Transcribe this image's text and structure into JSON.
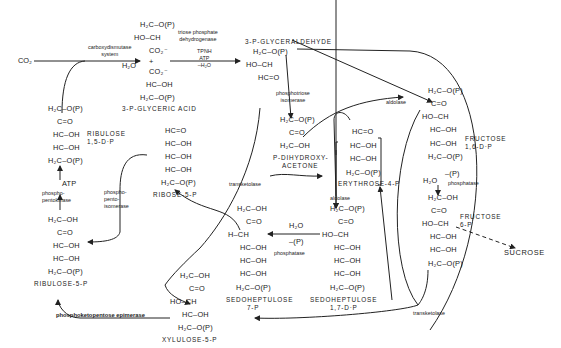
{
  "figure": {
    "inputs": {
      "co2": "CO₂",
      "h2o_in": "H₂O"
    },
    "outputs": {
      "sucrose": "SUCROSE"
    },
    "molecules": {
      "pga_top": [
        "H₂C–O(P)",
        "HO–CH",
        "CO₂⁻"
      ],
      "pga_plus": "+",
      "pga_bottom": [
        "CO₂⁻",
        "HC–OH",
        "H₂C–O(P)"
      ],
      "pga_label": "3-P-GLYCERIC ACID",
      "g3p": [
        "H₂C–O(P)",
        "HO–CH",
        "HC=O"
      ],
      "g3p_label": "3-P-GLYCERALDEHYDE",
      "dhap": [
        "H₂C–O(P)",
        "C=O",
        "H₂C–OH"
      ],
      "dhap_label": [
        "P-DIHYDROXY-",
        "ACETONE"
      ],
      "fdp": [
        "H₂C–O(P)",
        "C=O",
        "HO–CH",
        "HC–OH",
        "HC–OH",
        "H₂C–O(P)"
      ],
      "fdp_label": [
        "FRUCTOSE",
        "1,6-D·P"
      ],
      "f6p": [
        "H₂C–OH",
        "C=O",
        "HO–CH",
        "HC–OH",
        "HC–OH",
        "H₂C–O(P)"
      ],
      "f6p_label": [
        "FRUCTOSE",
        "6-P"
      ],
      "e4p": [
        "HC=O",
        "HC–OH",
        "HC–OH",
        "H₂C–O(P)"
      ],
      "e4p_label": "ERYTHROSE-4-P",
      "sdp": [
        "H₂C–O(P)",
        "C=O",
        "HO–CH",
        "HC–OH",
        "HC–OH",
        "HC–OH",
        "H₂C–O(P)"
      ],
      "sdp_label": [
        "SEDOHEPTULOSE",
        "1,7-D·P"
      ],
      "s7p": [
        "H₂C–OH",
        "C=O",
        "H–CH",
        "HC–OH",
        "HC–OH",
        "HC–OH",
        "H₂C–O(P)"
      ],
      "s7p_label": [
        "SEDOHEPTULOSE",
        "7-P"
      ],
      "r5p": [
        "HC=O",
        "HC–OH",
        "HC–OH",
        "HC–OH",
        "H₂C–O(P)"
      ],
      "r5p_label": "RIBOSE-5-P",
      "rudp": [
        "H₂C–O(P)",
        "C=O",
        "HC–OH",
        "HC–OH",
        "H₂C–O(P)"
      ],
      "rudp_label": [
        "RIBULOSE",
        "1,5-D·P"
      ],
      "ru5p": [
        "H₂C–OH",
        "C=O",
        "HC–OH",
        "HC–OH",
        "H₂C–O(P)"
      ],
      "ru5p_label": "RIBULOSE-5-P",
      "xu5p": [
        "H₂C–OH",
        "C=O",
        "HO–CH",
        "HC–OH",
        "H₂C–O(P)"
      ],
      "xu5p_label": "XYLULOSE-5-P"
    },
    "enzymes": {
      "carboxydismutase": "carboxydismutase\nsystem",
      "triose_dh": "triose phosphate\ndehydrogenase",
      "triose_dh_cofactors": "TPNH\nATP\n–H₂O",
      "triose_isomerase": "phosphotriose\nisomerase",
      "aldolase_top": "aldolase",
      "aldolase_mid": "aldolase",
      "phosphatase_fdp": "phosphatase",
      "phosphatase_fdp_h2o": "H₂O",
      "phosphatase_fdp_p": "–(P)",
      "phosphatase_sdp": "phosphatase",
      "phosphatase_sdp_h2o": "H₂O",
      "phosphatase_sdp_p": "–(P)",
      "transketolase_left": "transketolase",
      "transketolase_bottom": "transketolase",
      "pentose_isomerase": "phospho-\npento-\nisomerase",
      "pentokinase": "phospho-\npentokinase",
      "pentokinase_atp": "ATP",
      "epimerase": "phosphoketopentose epimerase"
    }
  }
}
